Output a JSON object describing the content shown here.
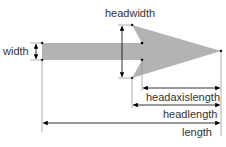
{
  "diagram": {
    "colors": {
      "arrow_fill": "#b3b3b3",
      "dimension_line": "#000000",
      "extension_line": "#999999",
      "text": "#333333"
    },
    "labels": {
      "width": "width",
      "headwidth": "headwidth",
      "headaxislength": "headaxislength",
      "headlength": "headlength",
      "length": "length"
    }
  }
}
